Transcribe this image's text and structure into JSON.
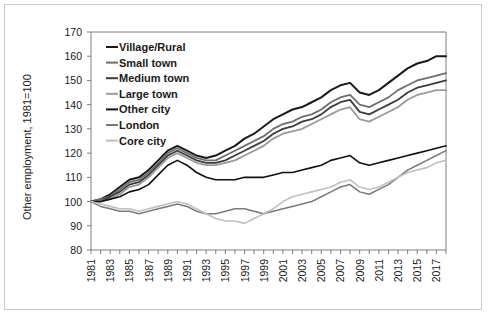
{
  "figure": {
    "background": "#ffffff",
    "border_color": "#c9c9c9"
  },
  "chart_data": {
    "type": "line",
    "title": "",
    "xlabel": "",
    "ylabel": "Other employment, 1981=100",
    "xlim": [
      1981,
      2018
    ],
    "ylim": [
      80,
      170
    ],
    "ytick_step": 10,
    "yticks": [
      80,
      90,
      100,
      110,
      120,
      130,
      140,
      150,
      160,
      170
    ],
    "grid": false,
    "legend_position": "top-left-inside",
    "x": [
      1981,
      1982,
      1983,
      1984,
      1985,
      1986,
      1987,
      1988,
      1989,
      1990,
      1991,
      1992,
      1993,
      1994,
      1995,
      1996,
      1997,
      1998,
      1999,
      2000,
      2001,
      2002,
      2003,
      2004,
      2005,
      2006,
      2007,
      2008,
      2009,
      2010,
      2011,
      2012,
      2013,
      2014,
      2015,
      2016,
      2017,
      2018
    ],
    "xticks": [
      1981,
      1982,
      1983,
      1984,
      1985,
      1986,
      1987,
      1988,
      1989,
      1990,
      1991,
      1992,
      1993,
      1994,
      1995,
      1996,
      1997,
      1998,
      1999,
      2000,
      2001,
      2002,
      2003,
      2004,
      2005,
      2006,
      2007,
      2008,
      2009,
      2010,
      2011,
      2012,
      2013,
      2014,
      2015,
      2016,
      2017,
      2018
    ],
    "xtick_labels_shown": [
      1981,
      1983,
      1985,
      1987,
      1989,
      1991,
      1993,
      1995,
      1997,
      1999,
      2001,
      2003,
      2005,
      2007,
      2009,
      2011,
      2013,
      2015,
      2017
    ],
    "series": [
      {
        "name": "Village/Rural",
        "color": "#1a1a1a",
        "width": 2.0,
        "values": [
          100,
          101,
          103,
          106,
          109,
          110,
          113,
          117,
          121,
          123,
          121,
          119,
          118,
          119,
          121,
          123,
          126,
          128,
          131,
          134,
          136,
          138,
          139,
          141,
          143,
          146,
          148,
          149,
          145,
          144,
          146,
          149,
          152,
          155,
          157,
          158,
          160,
          160
        ]
      },
      {
        "name": "Small town",
        "color": "#6e6e6e",
        "width": 1.8,
        "values": [
          100,
          101,
          102,
          105,
          108,
          109,
          112,
          116,
          120,
          122,
          120,
          118,
          117,
          117,
          119,
          121,
          123,
          125,
          127,
          130,
          132,
          133,
          135,
          136,
          138,
          141,
          143,
          144,
          140,
          139,
          141,
          143,
          146,
          148,
          150,
          151,
          152,
          153
        ]
      },
      {
        "name": "Medium town",
        "color": "#3c3c3c",
        "width": 1.8,
        "values": [
          100,
          100,
          102,
          104,
          107,
          108,
          111,
          115,
          119,
          121,
          119,
          117,
          116,
          116,
          117,
          119,
          121,
          123,
          125,
          128,
          130,
          131,
          133,
          134,
          136,
          139,
          141,
          142,
          137,
          136,
          138,
          140,
          142,
          145,
          147,
          148,
          149,
          150
        ]
      },
      {
        "name": "Large town",
        "color": "#9a9a9a",
        "width": 1.8,
        "values": [
          100,
          100,
          101,
          103,
          106,
          107,
          110,
          114,
          118,
          120,
          118,
          116,
          115,
          115,
          116,
          117,
          119,
          121,
          123,
          126,
          128,
          129,
          130,
          132,
          134,
          136,
          138,
          139,
          134,
          133,
          135,
          137,
          139,
          142,
          144,
          145,
          146,
          146
        ]
      },
      {
        "name": "Other city",
        "color": "#111111",
        "width": 1.6,
        "values": [
          100,
          100,
          101,
          102,
          104,
          105,
          107,
          111,
          115,
          117,
          115,
          112,
          110,
          109,
          109,
          109,
          110,
          110,
          110,
          111,
          112,
          112,
          113,
          114,
          115,
          117,
          118,
          119,
          116,
          115,
          116,
          117,
          118,
          119,
          120,
          121,
          122,
          123
        ]
      },
      {
        "name": "London",
        "color": "#7a7a7a",
        "width": 1.5,
        "values": [
          100,
          98,
          97,
          96,
          96,
          95,
          96,
          97,
          98,
          99,
          98,
          96,
          95,
          95,
          96,
          97,
          97,
          96,
          95,
          96,
          97,
          98,
          99,
          100,
          102,
          104,
          106,
          107,
          104,
          103,
          105,
          107,
          110,
          113,
          115,
          117,
          119,
          121
        ]
      },
      {
        "name": "Core city",
        "color": "#c0c0c0",
        "width": 1.6,
        "values": [
          100,
          99,
          98,
          97,
          97,
          96,
          97,
          98,
          99,
          100,
          99,
          97,
          95,
          93,
          92,
          92,
          91,
          93,
          95,
          97,
          100,
          102,
          103,
          104,
          105,
          106,
          108,
          109,
          106,
          105,
          106,
          108,
          110,
          112,
          113,
          114,
          116,
          117
        ]
      }
    ]
  }
}
